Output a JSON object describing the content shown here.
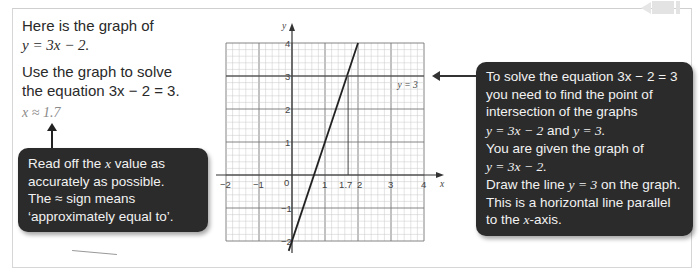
{
  "intro": {
    "line1": "Here is the graph of",
    "line2_eq": "y = 3x − 2.",
    "line3": "Use the graph to solve",
    "line4_prefix": "the equation ",
    "line4_eq": "3x − 2 = 3."
  },
  "answer": {
    "text": "x ≈ 1.7"
  },
  "callout_left": {
    "line1_a": "Read off the ",
    "line1_var": "x",
    "line1_b": " value as",
    "line2": "accurately as possible.",
    "line3": "The ≈ sign means",
    "line4": "‘approximately equal to’."
  },
  "callout_right": {
    "p1_a": "To solve the equation ",
    "p1_eq": "3x − 2 = 3",
    "p1_b": "you need to find the point of intersection of the graphs",
    "p2_eq1": "y = 3x − 2",
    "p2_and": " and ",
    "p2_eq2": "y = 3.",
    "p3_a": "You are given the graph of",
    "p3_eq": "y = 3x − 2.",
    "p4_a": "Draw the line ",
    "p4_eq": "y = 3",
    "p4_b": " on the graph. This is a horizontal line parallel to the ",
    "p4_var": "x",
    "p4_c": "-axis."
  },
  "chart_data": {
    "type": "line",
    "title": "",
    "xlabel": "x",
    "ylabel": "y",
    "xlim": [
      -2,
      4
    ],
    "ylim": [
      -2,
      4
    ],
    "grid": true,
    "x_ticks": [
      "−2",
      "−1",
      "0",
      "1",
      "2",
      "3",
      "4"
    ],
    "y_ticks": [
      "−2",
      "−1",
      "1",
      "2",
      "3",
      "4"
    ],
    "series": [
      {
        "name": "y = 3x − 2",
        "x": [
          -0.1,
          2.0
        ],
        "y": [
          -2.3,
          4.0
        ]
      },
      {
        "name": "y = 3",
        "x": [
          -2,
          4
        ],
        "y": [
          3,
          3
        ],
        "label": "y = 3"
      }
    ],
    "annotations": [
      {
        "type": "vertical_line",
        "x": 1.7,
        "y_from": 0,
        "y_to": 3,
        "label": "1.7"
      }
    ]
  }
}
